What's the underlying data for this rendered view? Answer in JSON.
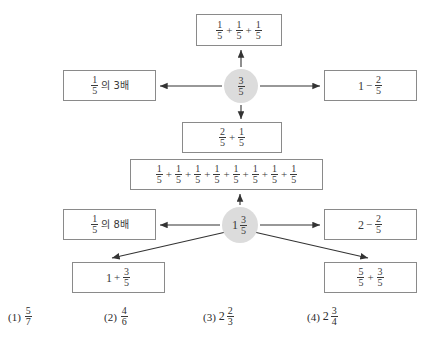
{
  "page": {
    "background_color": "#ffffff",
    "ink_color": "#3a3a3a",
    "node_fill_color": "#dcdcdc",
    "box_border_color": "#8a8a8a"
  },
  "diagram": {
    "nodes": [
      {
        "id": "node-top",
        "label": "3/5",
        "whole": "",
        "numerator": "3",
        "denominator": "5"
      },
      {
        "id": "node-bottom",
        "label": "1 3/5",
        "whole": "1",
        "numerator": "3",
        "denominator": "5"
      }
    ],
    "boxes": [
      {
        "id": "box-top",
        "text": "1/5 + 1/5 + 1/5",
        "parts": [
          {
            "type": "frac",
            "num": "1",
            "den": "5"
          },
          {
            "type": "op",
            "text": "+"
          },
          {
            "type": "frac",
            "num": "1",
            "den": "5"
          },
          {
            "type": "op",
            "text": "+"
          },
          {
            "type": "frac",
            "num": "1",
            "den": "5"
          }
        ]
      },
      {
        "id": "box-left-top",
        "text": "1/5의 3배",
        "parts": [
          {
            "type": "frac",
            "num": "1",
            "den": "5"
          },
          {
            "type": "ko",
            "text": "의 3배"
          }
        ]
      },
      {
        "id": "box-right-top",
        "text": "1 - 2/5",
        "parts": [
          {
            "type": "whole",
            "text": "1"
          },
          {
            "type": "op",
            "text": "−"
          },
          {
            "type": "frac",
            "num": "2",
            "den": "5"
          }
        ]
      },
      {
        "id": "box-mid",
        "text": "2/5 + 1/5",
        "parts": [
          {
            "type": "frac",
            "num": "2",
            "den": "5"
          },
          {
            "type": "op",
            "text": "+"
          },
          {
            "type": "frac",
            "num": "1",
            "den": "5"
          }
        ]
      },
      {
        "id": "box-long",
        "text": "1/5 + 1/5 + 1/5 + 1/5 + 1/5 + 1/5 + 1/5 + 1/5",
        "parts": [
          {
            "type": "frac",
            "num": "1",
            "den": "5"
          },
          {
            "type": "op",
            "text": "+"
          },
          {
            "type": "frac",
            "num": "1",
            "den": "5"
          },
          {
            "type": "op",
            "text": "+"
          },
          {
            "type": "frac",
            "num": "1",
            "den": "5"
          },
          {
            "type": "op",
            "text": "+"
          },
          {
            "type": "frac",
            "num": "1",
            "den": "5"
          },
          {
            "type": "op",
            "text": "+"
          },
          {
            "type": "frac",
            "num": "1",
            "den": "5"
          },
          {
            "type": "op",
            "text": "+"
          },
          {
            "type": "frac",
            "num": "1",
            "den": "5"
          },
          {
            "type": "op",
            "text": "+"
          },
          {
            "type": "frac",
            "num": "1",
            "den": "5"
          },
          {
            "type": "op",
            "text": "+"
          },
          {
            "type": "frac",
            "num": "1",
            "den": "5"
          }
        ]
      },
      {
        "id": "box-left-bot",
        "text": "1/5의 8배",
        "parts": [
          {
            "type": "frac",
            "num": "1",
            "den": "5"
          },
          {
            "type": "ko",
            "text": "의 8배"
          }
        ]
      },
      {
        "id": "box-right-bot",
        "text": "2 - 2/5",
        "parts": [
          {
            "type": "whole",
            "text": "2"
          },
          {
            "type": "op",
            "text": "−"
          },
          {
            "type": "frac",
            "num": "2",
            "den": "5"
          }
        ]
      },
      {
        "id": "box-bl",
        "text": "1 + 3/5",
        "parts": [
          {
            "type": "whole",
            "text": "1"
          },
          {
            "type": "op",
            "text": "+"
          },
          {
            "type": "frac",
            "num": "3",
            "den": "5"
          }
        ]
      },
      {
        "id": "box-br",
        "text": "5/5 + 3/5",
        "parts": [
          {
            "type": "frac",
            "num": "5",
            "den": "5"
          },
          {
            "type": "op",
            "text": "+"
          },
          {
            "type": "frac",
            "num": "3",
            "den": "5"
          }
        ]
      }
    ]
  },
  "choices": [
    {
      "label": "(1)",
      "text": "5/7",
      "left": 8,
      "parts": [
        {
          "type": "frac",
          "num": "5",
          "den": "7"
        }
      ]
    },
    {
      "label": "(2)",
      "text": "4/6",
      "left": 104,
      "parts": [
        {
          "type": "frac",
          "num": "4",
          "den": "6"
        }
      ]
    },
    {
      "label": "(3)",
      "text": "2 2/3",
      "left": 203,
      "parts": [
        {
          "type": "whole",
          "text": "2"
        },
        {
          "type": "frac",
          "num": "2",
          "den": "3"
        }
      ]
    },
    {
      "label": "(4)",
      "text": "2 3/4",
      "left": 307,
      "parts": [
        {
          "type": "whole",
          "text": "2"
        },
        {
          "type": "frac",
          "num": "3",
          "den": "4"
        }
      ]
    }
  ]
}
